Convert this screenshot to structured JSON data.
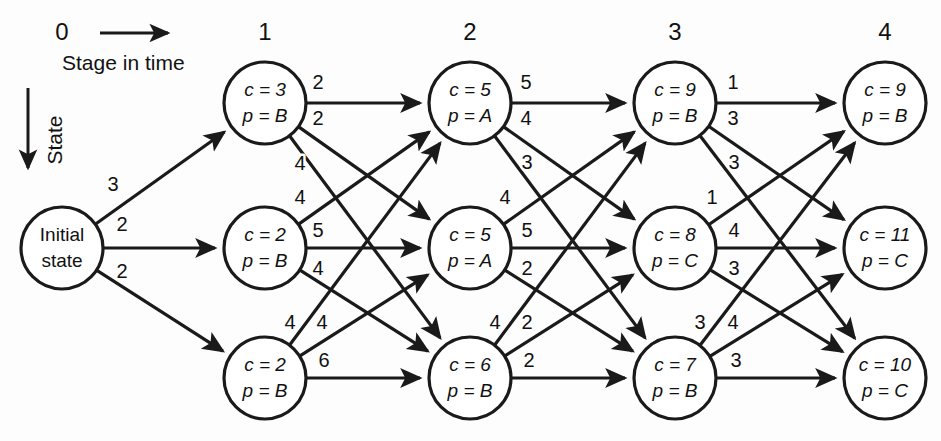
{
  "figure": {
    "background_color": "#fdfdfd",
    "ink_color": "#1a1a1a"
  },
  "axes": {
    "horizontal_caption": "Stage in time",
    "vertical_caption": "State",
    "stage_labels": [
      "0",
      "1",
      "2",
      "3",
      "4"
    ]
  },
  "initial_node": {
    "id": "init",
    "line1": "Initial",
    "line2": "state",
    "cx": 62,
    "cy": 248,
    "r": 41
  },
  "nodes": [
    {
      "id": "s1r1",
      "stage": 1,
      "row": 1,
      "line1": "c = 3",
      "line2": "p = B",
      "cx": 265,
      "cy": 103,
      "r": 41
    },
    {
      "id": "s1r2",
      "stage": 1,
      "row": 2,
      "line1": "c = 2",
      "line2": "p = B",
      "cx": 265,
      "cy": 248,
      "r": 41
    },
    {
      "id": "s1r3",
      "stage": 1,
      "row": 3,
      "line1": "c = 2",
      "line2": "p = B",
      "cx": 265,
      "cy": 378,
      "r": 41
    },
    {
      "id": "s2r1",
      "stage": 2,
      "row": 1,
      "line1": "c = 5",
      "line2": "p = A",
      "cx": 470,
      "cy": 103,
      "r": 41
    },
    {
      "id": "s2r2",
      "stage": 2,
      "row": 2,
      "line1": "c = 5",
      "line2": "p = A",
      "cx": 470,
      "cy": 248,
      "r": 41
    },
    {
      "id": "s2r3",
      "stage": 2,
      "row": 3,
      "line1": "c = 6",
      "line2": "p = B",
      "cx": 470,
      "cy": 378,
      "r": 41
    },
    {
      "id": "s3r1",
      "stage": 3,
      "row": 1,
      "line1": "c = 9",
      "line2": "p = B",
      "cx": 675,
      "cy": 103,
      "r": 41
    },
    {
      "id": "s3r2",
      "stage": 3,
      "row": 2,
      "line1": "c = 8",
      "line2": "p = C",
      "cx": 675,
      "cy": 248,
      "r": 41
    },
    {
      "id": "s3r3",
      "stage": 3,
      "row": 3,
      "line1": "c = 7",
      "line2": "p = B",
      "cx": 675,
      "cy": 378,
      "r": 41
    },
    {
      "id": "s4r1",
      "stage": 4,
      "row": 1,
      "line1": "c = 9",
      "line2": "p = B",
      "cx": 885,
      "cy": 103,
      "r": 41
    },
    {
      "id": "s4r2",
      "stage": 4,
      "row": 2,
      "line1": "c = 11",
      "line2": "p = C",
      "cx": 885,
      "cy": 248,
      "r": 41
    },
    {
      "id": "s4r3",
      "stage": 4,
      "row": 3,
      "line1": "c = 10",
      "line2": "p = C",
      "cx": 885,
      "cy": 378,
      "r": 41
    }
  ],
  "edges": [
    {
      "from": "init",
      "to": "s1r1",
      "weight": "3",
      "lx": 113,
      "ly": 186
    },
    {
      "from": "init",
      "to": "s1r2",
      "weight": "2",
      "lx": 122,
      "ly": 226
    },
    {
      "from": "init",
      "to": "s1r3",
      "weight": "2",
      "lx": 122,
      "ly": 273
    },
    {
      "from": "s1r1",
      "to": "s2r1",
      "weight": "2",
      "lx": 318,
      "ly": 84
    },
    {
      "from": "s1r1",
      "to": "s2r2",
      "weight": "2",
      "lx": 318,
      "ly": 120
    },
    {
      "from": "s1r1",
      "to": "s2r3",
      "weight": "4",
      "lx": 300,
      "ly": 165
    },
    {
      "from": "s1r2",
      "to": "s2r1",
      "weight": "4",
      "lx": 300,
      "ly": 199
    },
    {
      "from": "s1r2",
      "to": "s2r2",
      "weight": "5",
      "lx": 318,
      "ly": 232
    },
    {
      "from": "s1r2",
      "to": "s2r3",
      "weight": "4",
      "lx": 318,
      "ly": 270
    },
    {
      "from": "s1r3",
      "to": "s2r1",
      "weight": "4",
      "lx": 290,
      "ly": 324
    },
    {
      "from": "s1r3",
      "to": "s2r2",
      "weight": "4",
      "lx": 322,
      "ly": 324
    },
    {
      "from": "s1r3",
      "to": "s2r3",
      "weight": "6",
      "lx": 324,
      "ly": 362
    },
    {
      "from": "s2r1",
      "to": "s3r1",
      "weight": "5",
      "lx": 526,
      "ly": 84
    },
    {
      "from": "s2r1",
      "to": "s3r2",
      "weight": "4",
      "lx": 526,
      "ly": 120
    },
    {
      "from": "s2r1",
      "to": "s3r3",
      "weight": "3",
      "lx": 527,
      "ly": 164
    },
    {
      "from": "s2r2",
      "to": "s3r1",
      "weight": "4",
      "lx": 505,
      "ly": 199
    },
    {
      "from": "s2r2",
      "to": "s3r2",
      "weight": "5",
      "lx": 527,
      "ly": 232
    },
    {
      "from": "s2r2",
      "to": "s3r3",
      "weight": "2",
      "lx": 527,
      "ly": 270
    },
    {
      "from": "s2r3",
      "to": "s3r1",
      "weight": "4",
      "lx": 495,
      "ly": 324
    },
    {
      "from": "s2r3",
      "to": "s3r2",
      "weight": "2",
      "lx": 527,
      "ly": 324
    },
    {
      "from": "s2r3",
      "to": "s3r3",
      "weight": "2",
      "lx": 529,
      "ly": 362
    },
    {
      "from": "s3r1",
      "to": "s4r1",
      "weight": "1",
      "lx": 733,
      "ly": 84
    },
    {
      "from": "s3r1",
      "to": "s4r2",
      "weight": "3",
      "lx": 733,
      "ly": 120
    },
    {
      "from": "s3r1",
      "to": "s4r3",
      "weight": "3",
      "lx": 734,
      "ly": 164
    },
    {
      "from": "s3r2",
      "to": "s4r1",
      "weight": "1",
      "lx": 712,
      "ly": 199
    },
    {
      "from": "s3r2",
      "to": "s4r2",
      "weight": "4",
      "lx": 734,
      "ly": 232
    },
    {
      "from": "s3r2",
      "to": "s4r3",
      "weight": "3",
      "lx": 734,
      "ly": 270
    },
    {
      "from": "s3r3",
      "to": "s4r1",
      "weight": "3",
      "lx": 700,
      "ly": 324
    },
    {
      "from": "s3r3",
      "to": "s4r2",
      "weight": "4",
      "lx": 733,
      "ly": 324
    },
    {
      "from": "s3r3",
      "to": "s4r3",
      "weight": "3",
      "lx": 736,
      "ly": 362
    }
  ],
  "stage_label_positions": [
    {
      "label": "0",
      "x": 62,
      "y": 34
    },
    {
      "label": "1",
      "x": 265,
      "y": 34
    },
    {
      "label": "2",
      "x": 470,
      "y": 34
    },
    {
      "label": "3",
      "x": 675,
      "y": 34
    },
    {
      "label": "4",
      "x": 885,
      "y": 34
    }
  ]
}
